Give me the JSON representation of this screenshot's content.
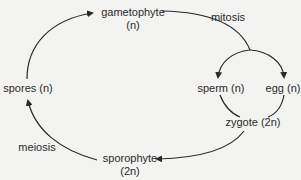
{
  "diagram": {
    "type": "life-cycle",
    "nodes": {
      "gametophyte": {
        "label": "gametophyte",
        "ploidy": "(n)"
      },
      "spores": {
        "label": "spores (n)"
      },
      "sperm": {
        "label": "sperm (n)"
      },
      "egg": {
        "label": "egg (n)"
      },
      "zygote": {
        "label": "zygote (2n)"
      },
      "sporophyte": {
        "label": "sporophyte",
        "ploidy": "(2n)"
      }
    },
    "processes": {
      "mitosis": "mitosis",
      "meiosis": "meiosis"
    },
    "edges": [
      {
        "from": "spores",
        "to": "gametophyte"
      },
      {
        "from": "gametophyte",
        "to": "sperm",
        "label": "mitosis"
      },
      {
        "from": "gametophyte",
        "to": "egg",
        "label": "mitosis"
      },
      {
        "from": "sperm",
        "to": "zygote"
      },
      {
        "from": "egg",
        "to": "zygote"
      },
      {
        "from": "zygote",
        "to": "sporophyte"
      },
      {
        "from": "sporophyte",
        "to": "spores",
        "label": "meiosis"
      }
    ],
    "colors": {
      "background": "#f3f3f1",
      "line": "#2a2a2a",
      "text": "#2a2a2a"
    }
  }
}
